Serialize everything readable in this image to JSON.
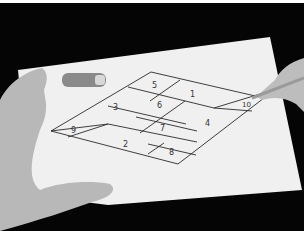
{
  "scene": {
    "description": "Black-and-white photo of hands drawing a parallelogram grid divided into 10 numbered regions on a sheet of paper, with a pen cap beside it",
    "colors": {
      "background": "#050505",
      "paper": "#f2f2f2",
      "lines": "#2a2a2a",
      "skin": "#b9b9b9"
    },
    "grid_labels": [
      {
        "id": "1",
        "x": 192,
        "y": 94
      },
      {
        "id": "2",
        "x": 125,
        "y": 143
      },
      {
        "id": "3",
        "x": 116,
        "y": 107
      },
      {
        "id": "4",
        "x": 207,
        "y": 123
      },
      {
        "id": "5",
        "x": 155,
        "y": 85
      },
      {
        "id": "6",
        "x": 159,
        "y": 105
      },
      {
        "id": "7",
        "x": 162,
        "y": 128
      },
      {
        "id": "8",
        "x": 171,
        "y": 152
      },
      {
        "id": "9",
        "x": 73,
        "y": 130
      },
      {
        "id": "10",
        "x": 246,
        "y": 104
      }
    ]
  }
}
